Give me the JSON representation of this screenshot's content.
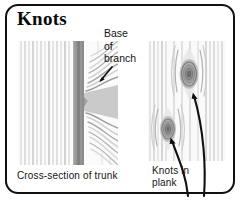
{
  "figure": {
    "title": "Knots",
    "border_color": "#111111",
    "background_color": "#ffffff",
    "text_color": "#141414"
  },
  "callouts": [
    {
      "name": "base-of-branch",
      "lines": [
        "Base",
        "of",
        "branch"
      ],
      "text": "Base of branch",
      "arrow": "diagonal-down-left"
    }
  ],
  "panels": [
    {
      "name": "cross-section-of-trunk",
      "caption": "Cross-section of trunk",
      "caption_lines": [
        "Cross-section of trunk"
      ],
      "image_alt": "wood grain cross-section with dark vertical branch base"
    },
    {
      "name": "knots-in-plank",
      "caption": "Knots in plank",
      "caption_lines": [
        "Knots in",
        "plank"
      ],
      "image_alt": "plank with two oval knots and vertical grain",
      "knots": [
        {
          "name": "upper-knot",
          "arrow": "curved-up-left"
        },
        {
          "name": "lower-knot",
          "arrow": "curved-up-left"
        }
      ]
    }
  ],
  "colors": {
    "ink": "#111111",
    "grain_light": "#f2f2f2",
    "grain_mid": "#c9c9c9",
    "grain_dark": "#8e8e8e",
    "branch_dark": "#8a8a8a"
  }
}
